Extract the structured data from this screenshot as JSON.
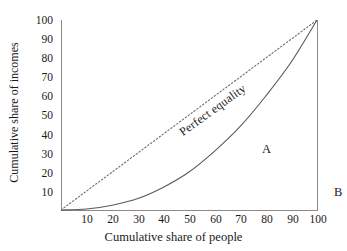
{
  "chart_data": {
    "type": "line",
    "title": "",
    "xlabel": "Cumulative share of people",
    "ylabel": "Cumulative share of incomes",
    "xlim": [
      0,
      100
    ],
    "ylim": [
      0,
      100
    ],
    "xticks": [
      10,
      20,
      30,
      40,
      50,
      60,
      70,
      80,
      90,
      100
    ],
    "yticks": [
      10,
      20,
      30,
      40,
      50,
      60,
      70,
      80,
      90,
      100
    ],
    "grid": false,
    "legend": "none",
    "series": [
      {
        "name": "Perfect equality",
        "style": "dotted",
        "color": "#6b6b6b",
        "x": [
          0,
          100
        ],
        "values": [
          0,
          100
        ]
      },
      {
        "name": "Lorenz curve",
        "style": "solid",
        "color": "#5a5a5a",
        "x": [
          0,
          10,
          20,
          30,
          40,
          50,
          60,
          70,
          80,
          90,
          100
        ],
        "values": [
          0,
          0.5,
          2.5,
          6,
          12,
          20,
          31,
          44,
          60,
          78,
          100
        ]
      }
    ],
    "annotations": [
      {
        "text": "Perfect equality",
        "x": 26,
        "y": 55,
        "rotation": -36
      },
      {
        "text": "A",
        "x": 55,
        "y": 44
      },
      {
        "text": "B",
        "x": 83,
        "y": 21
      }
    ]
  },
  "axes": {
    "y": {
      "title": "Cumulative share of incomes",
      "ticks": [
        "100",
        "90",
        "80",
        "70",
        "60",
        "50",
        "40",
        "30",
        "20",
        "10"
      ]
    },
    "x": {
      "title": "Cumulative share of people",
      "ticks": [
        "10",
        "20",
        "30",
        "40",
        "50",
        "60",
        "70",
        "80",
        "90",
        "100"
      ]
    }
  },
  "annotations": {
    "equality_label": "Perfect equality",
    "area_a": "A",
    "area_b": "B"
  },
  "colors": {
    "axis": "#8a8a8a",
    "curve": "#5a5a5a",
    "equality": "#6b6b6b",
    "text": "#1a1a1a",
    "background": "#ffffff"
  }
}
